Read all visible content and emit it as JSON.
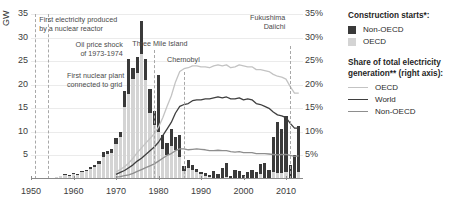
{
  "axes": {
    "left_title": "GW",
    "left_ticks": [
      "35",
      "30",
      "25",
      "20",
      "15",
      "10",
      "5"
    ],
    "right_ticks": [
      "35%",
      "30%",
      "25%",
      "20%",
      "15%",
      "10%",
      "5%"
    ],
    "x_ticks": [
      "1950",
      "1960",
      "1970",
      "1980",
      "1990",
      "2000",
      "2010"
    ]
  },
  "annotations": [
    {
      "name": "first-electricity",
      "text": "First electricity produced\nby a nuclear reactor",
      "year": 1951
    },
    {
      "name": "first-plant-grid",
      "text": "First nuclear plant\nconnected to grid",
      "year": 1954
    },
    {
      "name": "oil-price-shock",
      "text": "Oil price shock\nof 1973-1974",
      "year": 1973
    },
    {
      "name": "three-mile-island",
      "text": "Three Mile Island",
      "year": 1979
    },
    {
      "name": "chernobyl",
      "text": "Chernobyl",
      "year": 1986
    },
    {
      "name": "fukushima-daiichi",
      "text": "Fukushima\nDaiichi",
      "year": 2011
    }
  ],
  "legend": {
    "bars_title": "Construction starts*:",
    "bars": [
      {
        "label": "Non-OECD",
        "color": "#3a3a3a"
      },
      {
        "label": "OECD",
        "color": "#d4d4d4"
      }
    ],
    "lines_title": "Share of total electricity\ngeneration** (right axis):",
    "lines": [
      {
        "label": "OECD",
        "color": "#c3c3c3"
      },
      {
        "label": "World",
        "color": "#3f3f3f"
      },
      {
        "label": "Non-OECD",
        "color": "#8e8e8e"
      }
    ]
  },
  "chart_data": {
    "type": "bar",
    "title": "",
    "xlabel": "",
    "ylabel": "GW",
    "ylabel_right": "Share of total electricity generation (%)",
    "xlim": [
      1950,
      2014
    ],
    "ylim": [
      0,
      35
    ],
    "ylim_right": [
      0,
      35
    ],
    "grid": true,
    "legend_position": "right",
    "years": [
      1950,
      1951,
      1952,
      1953,
      1954,
      1955,
      1956,
      1957,
      1958,
      1959,
      1960,
      1961,
      1962,
      1963,
      1964,
      1965,
      1966,
      1967,
      1968,
      1969,
      1970,
      1971,
      1972,
      1973,
      1974,
      1975,
      1976,
      1977,
      1978,
      1979,
      1980,
      1981,
      1982,
      1983,
      1984,
      1985,
      1986,
      1987,
      1988,
      1989,
      1990,
      1991,
      1992,
      1993,
      1994,
      1995,
      1996,
      1997,
      1998,
      1999,
      2000,
      2001,
      2002,
      2003,
      2004,
      2005,
      2006,
      2007,
      2008,
      2009,
      2010,
      2011,
      2012,
      2013
    ],
    "series": [
      {
        "name": "OECD",
        "type": "bar",
        "stack": "construction",
        "color": "#d4d4d4",
        "unit": "GW",
        "values": [
          0,
          0,
          0,
          0,
          0.2,
          0.3,
          0.5,
          0.6,
          0.8,
          0.7,
          1.0,
          0.9,
          1.4,
          1.6,
          2.2,
          2.6,
          3.2,
          4.6,
          5.4,
          5.6,
          7.4,
          9.0,
          15.2,
          18.0,
          21.2,
          22.4,
          26.5,
          21.0,
          14.0,
          11.5,
          10.0,
          6.4,
          5.0,
          7.0,
          6.2,
          4.6,
          1.6,
          2.4,
          2.0,
          1.4,
          1.0,
          0.6,
          0.4,
          0.0,
          0.0,
          0.0,
          0.4,
          0.0,
          0.0,
          0.0,
          0.0,
          0.0,
          0.0,
          0.0,
          1.0,
          0.0,
          0.0,
          1.4,
          1.2,
          1.3,
          1.4,
          0.0,
          0.0,
          1.4
        ]
      },
      {
        "name": "Non-OECD",
        "type": "bar",
        "stack": "construction",
        "color": "#3a3a3a",
        "unit": "GW",
        "values": [
          0,
          0,
          0,
          0,
          0,
          0,
          0,
          0,
          0.2,
          0.2,
          0.2,
          0.2,
          0.3,
          0.3,
          0.4,
          0.4,
          0.6,
          1.2,
          0.6,
          0.8,
          1.4,
          1.0,
          3.4,
          7.4,
          2.4,
          3.4,
          7.0,
          4.4,
          5.0,
          3.0,
          12.0,
          3.0,
          2.6,
          3.6,
          2.8,
          4.8,
          1.2,
          1.6,
          1.0,
          0.8,
          0.4,
          0.6,
          0.4,
          1.8,
          1.0,
          2.4,
          3.0,
          0.6,
          2.0,
          1.6,
          0.8,
          1.4,
          2.0,
          1.4,
          2.2,
          3.4,
          2.0,
          7.6,
          11.0,
          9.4,
          12.0,
          3.0,
          5.0,
          9.8
        ]
      },
      {
        "name": "OECD",
        "type": "line",
        "axis": "right",
        "color": "#c3c3c3",
        "unit": "%",
        "values": [
          null,
          null,
          null,
          null,
          null,
          null,
          null,
          null,
          null,
          null,
          null,
          null,
          null,
          null,
          null,
          null,
          null,
          null,
          null,
          null,
          1.5,
          2.0,
          2.6,
          3.4,
          4.4,
          5.6,
          6.6,
          7.6,
          8.6,
          9.6,
          11.0,
          13.0,
          15.4,
          17.6,
          20.6,
          22.8,
          23.4,
          23.6,
          24.0,
          24.0,
          23.8,
          23.8,
          23.6,
          24.0,
          24.2,
          24.0,
          24.2,
          23.6,
          23.8,
          24.2,
          24.0,
          23.8,
          23.8,
          23.2,
          23.2,
          23.0,
          22.8,
          22.2,
          21.8,
          21.6,
          21.2,
          19.6,
          18.2,
          18.2
        ]
      },
      {
        "name": "World",
        "type": "line",
        "axis": "right",
        "color": "#3f3f3f",
        "unit": "%",
        "values": [
          null,
          null,
          null,
          null,
          null,
          null,
          null,
          null,
          null,
          null,
          null,
          null,
          null,
          null,
          null,
          null,
          null,
          null,
          null,
          null,
          1.0,
          1.4,
          1.8,
          2.4,
          3.0,
          3.8,
          4.4,
          5.2,
          6.0,
          6.8,
          7.8,
          9.2,
          10.6,
          12.0,
          14.0,
          15.4,
          15.8,
          16.0,
          16.6,
          16.8,
          16.8,
          17.0,
          17.0,
          17.2,
          17.4,
          17.2,
          17.4,
          17.0,
          17.0,
          17.2,
          16.8,
          17.0,
          16.8,
          16.0,
          15.8,
          15.4,
          15.0,
          14.2,
          13.6,
          13.4,
          13.0,
          11.8,
          10.8,
          10.8
        ]
      },
      {
        "name": "Non-OECD",
        "type": "line",
        "axis": "right",
        "color": "#8e8e8e",
        "unit": "%",
        "values": [
          null,
          null,
          null,
          null,
          null,
          null,
          null,
          null,
          null,
          null,
          null,
          null,
          null,
          null,
          null,
          null,
          null,
          null,
          null,
          null,
          0.4,
          0.5,
          0.7,
          0.9,
          1.2,
          1.6,
          2.0,
          2.4,
          2.8,
          3.2,
          3.8,
          4.4,
          5.0,
          5.4,
          6.0,
          6.4,
          6.4,
          6.2,
          6.3,
          6.4,
          6.3,
          6.2,
          6.0,
          6.0,
          6.1,
          6.0,
          6.0,
          5.8,
          5.7,
          5.8,
          5.6,
          5.6,
          5.6,
          5.4,
          5.4,
          5.4,
          5.3,
          5.2,
          5.1,
          5.2,
          5.2,
          5.0,
          4.8,
          4.9
        ]
      }
    ]
  }
}
